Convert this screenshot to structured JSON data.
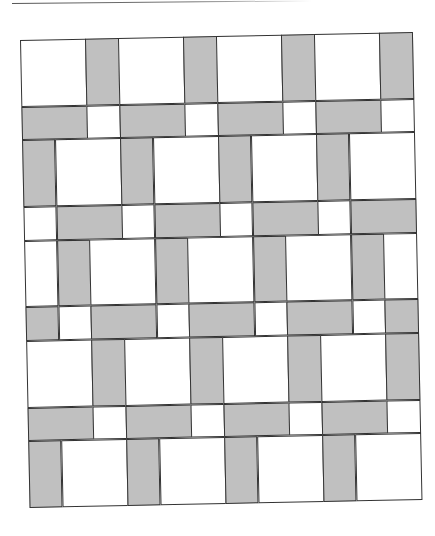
{
  "figure": {
    "colors": {
      "gray": "#c0c0c0",
      "white": "#ffffff",
      "stroke": "#333333"
    },
    "units": {
      "columns": 12,
      "rows": 14
    },
    "rows": [
      {
        "height": 2,
        "cells": [
          [
            "white",
            2
          ],
          [
            "gray",
            1
          ],
          [
            "white",
            2
          ],
          [
            "gray",
            1
          ],
          [
            "white",
            2
          ],
          [
            "gray",
            1
          ],
          [
            "white",
            2
          ],
          [
            "gray",
            1
          ]
        ]
      },
      {
        "height": 1,
        "cells": [
          [
            "gray",
            2
          ],
          [
            "white",
            1
          ],
          [
            "gray",
            2
          ],
          [
            "white",
            1
          ],
          [
            "gray",
            2
          ],
          [
            "white",
            1
          ],
          [
            "gray",
            2
          ],
          [
            "white",
            1
          ]
        ]
      },
      {
        "height": 2,
        "cells": [
          [
            "gray",
            1
          ],
          [
            "white",
            2
          ],
          [
            "gray",
            1
          ],
          [
            "white",
            2
          ],
          [
            "gray",
            1
          ],
          [
            "white",
            2
          ],
          [
            "gray",
            1
          ],
          [
            "white",
            2
          ]
        ]
      },
      {
        "height": 1,
        "cells": [
          [
            "white",
            1
          ],
          [
            "gray",
            2
          ],
          [
            "white",
            1
          ],
          [
            "gray",
            2
          ],
          [
            "white",
            1
          ],
          [
            "gray",
            2
          ],
          [
            "white",
            1
          ],
          [
            "gray",
            2
          ]
        ]
      },
      {
        "height": 2,
        "cells": [
          [
            "white",
            1
          ],
          [
            "gray",
            1
          ],
          [
            "white",
            2
          ],
          [
            "gray",
            1
          ],
          [
            "white",
            2
          ],
          [
            "gray",
            1
          ],
          [
            "white",
            2
          ],
          [
            "gray",
            1
          ],
          [
            "white",
            1
          ]
        ]
      },
      {
        "height": 1,
        "cells": [
          [
            "gray",
            1
          ],
          [
            "white",
            1
          ],
          [
            "gray",
            2
          ],
          [
            "white",
            1
          ],
          [
            "gray",
            2
          ],
          [
            "white",
            1
          ],
          [
            "gray",
            2
          ],
          [
            "white",
            1
          ],
          [
            "gray",
            1
          ]
        ]
      },
      {
        "height": 2,
        "cells": [
          [
            "white",
            2
          ],
          [
            "gray",
            1
          ],
          [
            "white",
            2
          ],
          [
            "gray",
            1
          ],
          [
            "white",
            2
          ],
          [
            "gray",
            1
          ],
          [
            "white",
            2
          ],
          [
            "gray",
            1
          ]
        ]
      },
      {
        "height": 1,
        "cells": [
          [
            "gray",
            2
          ],
          [
            "white",
            1
          ],
          [
            "gray",
            2
          ],
          [
            "white",
            1
          ],
          [
            "gray",
            2
          ],
          [
            "white",
            1
          ],
          [
            "gray",
            2
          ],
          [
            "white",
            1
          ]
        ]
      },
      {
        "height": 2,
        "cells": [
          [
            "gray",
            1
          ],
          [
            "white",
            2
          ],
          [
            "gray",
            1
          ],
          [
            "white",
            2
          ],
          [
            "gray",
            1
          ],
          [
            "white",
            2
          ],
          [
            "gray",
            1
          ],
          [
            "white",
            2
          ]
        ]
      }
    ]
  }
}
